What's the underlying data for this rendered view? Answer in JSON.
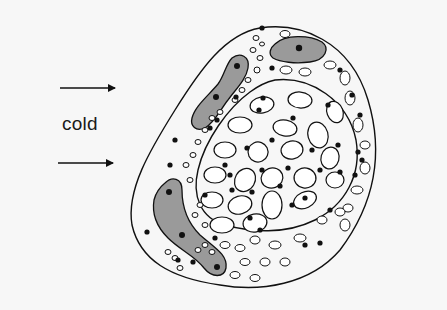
{
  "figure": {
    "label": "cold",
    "arrows": [
      {
        "name": "cold-arrow-top",
        "direction": "right"
      },
      {
        "name": "cold-arrow-bottom",
        "direction": "right"
      }
    ],
    "colors": {
      "background": "#f7f7f7",
      "outline": "#111111",
      "shaded_cell": "#9a9a9a",
      "nucleus": "#111111",
      "vacuole_fill": "#ffffff"
    },
    "components": [
      "outer-boundary",
      "inner-boundary",
      "elongated-shaded-cell-upper",
      "elongated-shaded-cell-lower",
      "shaded-cell-top",
      "vacuoles",
      "nuclei-dots"
    ]
  }
}
